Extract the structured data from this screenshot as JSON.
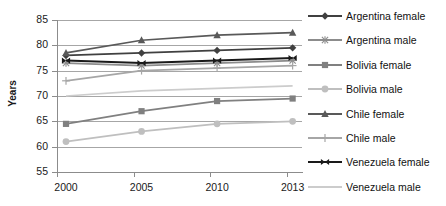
{
  "chart_data": {
    "type": "line",
    "title": "",
    "xlabel": "",
    "ylabel": "Years",
    "x": [
      "2000",
      "2005",
      "2010",
      "2013"
    ],
    "categories": [
      "2000",
      "2005",
      "2010",
      "2013"
    ],
    "ylim": [
      55,
      85
    ],
    "yticks": [
      55,
      60,
      65,
      70,
      75,
      80,
      85
    ],
    "grid": true,
    "legend_position": "right",
    "series": [
      {
        "name": "Argentina female",
        "values": [
          78.0,
          78.5,
          79.0,
          79.5
        ],
        "color": "#404040",
        "marker": "diamond"
      },
      {
        "name": "Argentina male",
        "values": [
          76.5,
          76.0,
          76.5,
          77.0
        ],
        "color": "#8c8c8c",
        "marker": "asterisk"
      },
      {
        "name": "Bolivia female",
        "values": [
          64.5,
          67.0,
          69.0,
          69.5
        ],
        "color": "#808080",
        "marker": "square"
      },
      {
        "name": "Bolivia male",
        "values": [
          61.0,
          63.0,
          64.5,
          65.0
        ],
        "color": "#bfbfbf",
        "marker": "circle"
      },
      {
        "name": "Chile female",
        "values": [
          78.5,
          81.0,
          82.0,
          82.5
        ],
        "color": "#595959",
        "marker": "triangle"
      },
      {
        "name": "Chile male",
        "values": [
          73.0,
          75.0,
          75.5,
          76.0
        ],
        "color": "#a6a6a6",
        "marker": "plus"
      },
      {
        "name": "Venezuela female",
        "values": [
          77.0,
          76.5,
          77.0,
          77.5
        ],
        "color": "#1a1a1a",
        "marker": "bowtie"
      },
      {
        "name": "Venezuela male",
        "values": [
          70.0,
          71.0,
          71.5,
          72.0
        ],
        "color": "#cccccc",
        "marker": "none"
      }
    ]
  },
  "axis": {
    "y_title": "Years",
    "y_labels": [
      "85",
      "80",
      "75",
      "70",
      "65",
      "60",
      "55"
    ],
    "x_labels": [
      "2000",
      "2005",
      "2010",
      "2013"
    ]
  },
  "legend": {
    "items": [
      {
        "label": "Argentina female"
      },
      {
        "label": "Argentina male"
      },
      {
        "label": "Bolivia female"
      },
      {
        "label": "Bolivia male"
      },
      {
        "label": "Chile female"
      },
      {
        "label": "Chile male"
      },
      {
        "label": "Venezuela female"
      },
      {
        "label": "Venezuela male"
      }
    ]
  },
  "colors": {
    "gridline": "#a6a6a6",
    "axis": "#8c8c8c",
    "text": "#1a1a1a",
    "background": "#ffffff"
  }
}
